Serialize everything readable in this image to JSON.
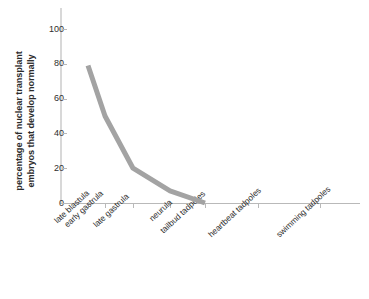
{
  "chart_data": {
    "type": "line",
    "title": "",
    "subtitle": "",
    "xlabel": "",
    "ylabel": "percentage of nuclear transplant embryos that develop normally",
    "ylabel_lines": [
      "percentage of nuclear transplant",
      "embryos that develop normally"
    ],
    "categories": [
      "late blastula",
      "early gastrula",
      "late gastrula",
      "neurula",
      "tailbud tadpoles",
      "heartbeat tadpoles",
      "swimming tadpoles"
    ],
    "values": [
      79,
      50,
      20,
      7,
      0,
      0,
      0
    ],
    "series": [
      {
        "name": "percentage of nuclear transplant embryos that develop normally",
        "values": [
          79,
          50,
          20,
          7,
          0,
          0,
          0
        ]
      }
    ],
    "ylim": [
      0,
      105
    ],
    "yticks": [
      0,
      20,
      40,
      60,
      80,
      100
    ],
    "ytick_labels": [
      "0",
      "20",
      "40",
      "60",
      "80",
      "100"
    ],
    "xlim": [
      0,
      7
    ],
    "grid": false,
    "legend": false,
    "legend_position": "none",
    "line_color": "#a3a3a3",
    "line_width": 5,
    "axis_color": "#b9b9b9",
    "spine_color": "#d8d8d8",
    "text_color": "#2e2e2e",
    "background": "#ffffff",
    "annotations": []
  },
  "axis": {
    "y_tick_labels": [
      "0",
      "20",
      "40",
      "60",
      "80",
      "100"
    ],
    "x_tick_labels": [
      "late blastula",
      "early gastrula",
      "late gastrula",
      "neurula",
      "tailbud tadpoles",
      "heartbeat tadpoles",
      "swimming tadpoles"
    ]
  }
}
